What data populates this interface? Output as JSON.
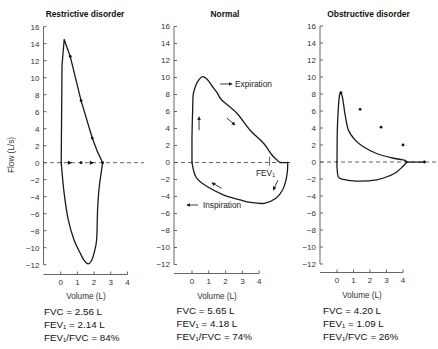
{
  "figure": {
    "ylabel": "Flow (L/s)"
  },
  "chart_data": [
    {
      "type": "line",
      "title": "Restrictive disorder",
      "xlabel": "Volume (L)",
      "ylabel": "Flow (L/s)",
      "xticks": [
        0,
        1,
        2,
        3,
        4
      ],
      "yticks": [
        16,
        14,
        12,
        10,
        8,
        6,
        4,
        2,
        0,
        -2,
        -4,
        -6,
        -8,
        -10,
        -12
      ],
      "xlim": [
        -1,
        4
      ],
      "ylim": [
        -12,
        16
      ],
      "grid": false,
      "series": [
        {
          "name": "Expiration",
          "smooth": false,
          "points": [
            [
              0.03,
              0
            ],
            [
              0.08,
              11.5
            ],
            [
              0.21,
              14.5
            ],
            [
              0.57,
              12.5
            ],
            [
              1.22,
              7.3
            ],
            [
              1.89,
              2.9
            ],
            [
              2.2,
              1.3
            ],
            [
              2.51,
              0
            ]
          ]
        },
        {
          "name": "Inspiration",
          "smooth": true,
          "points": [
            [
              2.51,
              0
            ],
            [
              2.3,
              -3
            ],
            [
              2.21,
              -5.5
            ],
            [
              2.15,
              -9.1
            ],
            [
              2.0,
              -10.6
            ],
            [
              1.85,
              -11.5
            ],
            [
              1.64,
              -11.9
            ],
            [
              1.4,
              -11.5
            ],
            [
              1.16,
              -10.6
            ],
            [
              0.8,
              -9.1
            ],
            [
              0.45,
              -6.7
            ],
            [
              0.2,
              -3.5
            ],
            [
              0.03,
              0
            ]
          ]
        }
      ],
      "dots": [
        [
          0.57,
          12.5
        ],
        [
          1.22,
          7.3
        ],
        [
          1.89,
          2.9
        ],
        [
          1.22,
          0
        ],
        [
          2.51,
          0
        ]
      ],
      "baseline_arrows": [
        0.56,
        1.87
      ],
      "annotations": [],
      "stats": [
        "FVC = 2.56 L",
        "FEV₁ = 2.14 L",
        "FEV₁/FVC = 84%"
      ],
      "values": {
        "FVC_L": 2.56,
        "FEV1_L": 2.14,
        "FEV1_FVC_pct": 84
      }
    },
    {
      "type": "line",
      "title": "Normal",
      "xlabel": "Volume (L)",
      "ylabel": "Flow (L/s)",
      "xticks": [
        0,
        1,
        2,
        3,
        4
      ],
      "yticks": [
        16,
        14,
        12,
        10,
        8,
        6,
        4,
        2,
        0,
        -2,
        -4,
        -6,
        -8,
        -10,
        -12
      ],
      "xlim": [
        -1,
        4
      ],
      "ylim": [
        -12,
        16
      ],
      "grid": false,
      "series": [
        {
          "name": "Expiration",
          "smooth": true,
          "points": [
            [
              0,
              0
            ],
            [
              0,
              3.0
            ],
            [
              0.04,
              6.2
            ],
            [
              0.08,
              8.1
            ],
            [
              0.28,
              9.3
            ],
            [
              0.48,
              9.9
            ],
            [
              0.64,
              10.1
            ],
            [
              0.9,
              9.8
            ],
            [
              1.2,
              9.0
            ],
            [
              1.5,
              8.2
            ],
            [
              1.77,
              7.35
            ],
            [
              2.67,
              5.8
            ],
            [
              3.46,
              3.8
            ],
            [
              4.26,
              2.26
            ],
            [
              4.76,
              0.88
            ],
            [
              5.06,
              0.3
            ],
            [
              5.25,
              0
            ],
            [
              5.7,
              0
            ]
          ]
        },
        {
          "name": "Inspiration",
          "smooth": true,
          "points": [
            [
              5.7,
              0
            ],
            [
              5.68,
              -1.0
            ],
            [
              5.6,
              -2.0
            ],
            [
              5.4,
              -3.2
            ],
            [
              5.0,
              -4.2
            ],
            [
              4.3,
              -4.8
            ],
            [
              3.5,
              -4.7
            ],
            [
              2.87,
              -4.4
            ],
            [
              1.86,
              -3.8
            ],
            [
              0.87,
              -2.8
            ],
            [
              0.3,
              -1.9
            ],
            [
              0.1,
              -1.0
            ],
            [
              0,
              0
            ]
          ]
        }
      ],
      "dots": [],
      "baseline_arrows": [],
      "fev1_marker": {
        "volume": 4.62,
        "from": 0.7,
        "to": -0.4
      },
      "flow_arrows": [
        [
          [
            0.42,
            3.8
          ],
          [
            0.42,
            5.35
          ]
        ],
        [
          [
            2.07,
            5.24
          ],
          [
            2.56,
            4.41
          ]
        ],
        [
          [
            1.77,
            -3.04
          ],
          [
            1.19,
            -2.4
          ]
        ],
        [
          [
            5.12,
            -2.06
          ],
          [
            4.84,
            -3.24
          ]
        ]
      ],
      "annotations": [
        {
          "text": "Expiration",
          "at": [
            2.56,
            8.9
          ],
          "arrow": [
            [
              1.67,
              9.24
            ],
            [
              2.38,
              9.24
            ]
          ]
        },
        {
          "text": "Inspiration",
          "at": [
            0.65,
            -5.4
          ],
          "arrow": [
            [
              0.36,
              -5.0
            ],
            [
              -0.3,
              -5.0
            ]
          ]
        },
        {
          "text": "FEV₁",
          "at": [
            3.81,
            -1.6
          ]
        }
      ],
      "stats": [
        "FVC = 5.65 L",
        "FEV₁ = 4.18 L",
        "FEV₁/FVC = 74%"
      ],
      "values": {
        "FVC_L": 5.65,
        "FEV1_L": 4.18,
        "FEV1_FVC_pct": 74
      }
    },
    {
      "type": "line",
      "title": "Obstructive disorder",
      "xlabel": "Volume (L)",
      "ylabel": "Flow (L/s)",
      "xticks": [
        0,
        1,
        2,
        3,
        4
      ],
      "yticks": [
        16,
        14,
        12,
        10,
        8,
        6,
        4,
        2,
        0,
        -2,
        -4,
        -6,
        -8,
        -10,
        -12
      ],
      "xlim": [
        -1,
        4
      ],
      "ylim": [
        -12,
        16
      ],
      "grid": false,
      "series": [
        {
          "name": "Expiration",
          "smooth": true,
          "points": [
            [
              0,
              0
            ],
            [
              0.02,
              3.8
            ],
            [
              0.08,
              6.3
            ],
            [
              0.15,
              7.8
            ],
            [
              0.24,
              8.15
            ],
            [
              0.33,
              7.6
            ],
            [
              0.42,
              6.5
            ],
            [
              0.48,
              5.7
            ],
            [
              0.69,
              3.76
            ],
            [
              1.09,
              2.6
            ],
            [
              1.6,
              1.8
            ],
            [
              2.4,
              1.0
            ],
            [
              3.3,
              0.5
            ],
            [
              4.12,
              0.2
            ],
            [
              4.25,
              0
            ],
            [
              5.3,
              0
            ]
          ]
        },
        {
          "name": "Inspiration",
          "smooth": true,
          "points": [
            [
              4.25,
              0
            ],
            [
              4.0,
              -0.5
            ],
            [
              3.6,
              -1.2
            ],
            [
              3.21,
              -1.6
            ],
            [
              2.4,
              -2.1
            ],
            [
              1.19,
              -2.24
            ],
            [
              0.38,
              -2.04
            ],
            [
              0.08,
              -1.73
            ],
            [
              0,
              -0.55
            ],
            [
              0,
              0
            ]
          ]
        }
      ],
      "dots": [
        [
          0.24,
          8.15
        ],
        [
          1.4,
          6.2
        ],
        [
          2.67,
          4.1
        ],
        [
          4.0,
          2.0
        ],
        [
          5.3,
          0
        ]
      ],
      "baseline_arrows": [],
      "annotations": [],
      "stats": [
        "FVC = 4.20 L",
        "FEV₁ = 1.09 L",
        "FEV₁/FVC = 26%"
      ],
      "values": {
        "FVC_L": 4.2,
        "FEV1_L": 1.09,
        "FEV1_FVC_pct": 26
      }
    }
  ]
}
